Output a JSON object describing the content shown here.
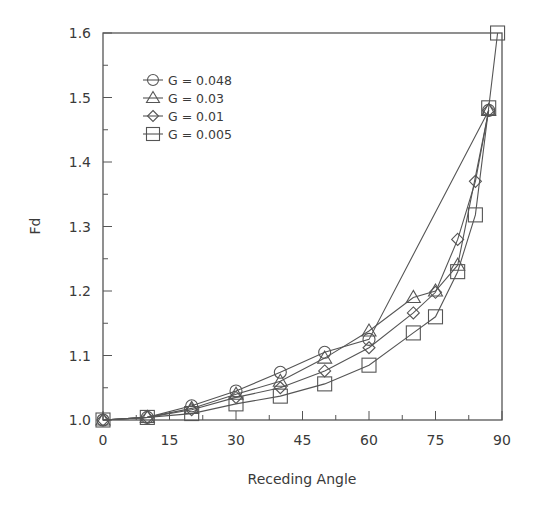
{
  "chart_data": {
    "type": "line",
    "title": "",
    "xlabel": "Receding Angle",
    "ylabel": "Fd",
    "xlim": [
      0,
      90
    ],
    "ylim": [
      1.0,
      1.6
    ],
    "xticks": [
      0,
      15,
      30,
      45,
      60,
      75,
      90
    ],
    "xtick_labels": [
      "0",
      "15",
      "30",
      "45",
      "60",
      "75",
      "90"
    ],
    "x_minor_step": 7.5,
    "yticks": [
      1.0,
      1.1,
      1.2,
      1.3,
      1.4,
      1.5,
      1.6
    ],
    "ytick_labels": [
      "1.0",
      "1.1",
      "1.2",
      "1.3",
      "1.4",
      "1.5",
      "1.6"
    ],
    "y_minor_step": 0.05,
    "grid": false,
    "legend_position": "upper left",
    "line_color": "#555555",
    "series": [
      {
        "name": "G = 0.048",
        "marker": "circle",
        "x": [
          0,
          10,
          20,
          30,
          40,
          50,
          60,
          87
        ],
        "y": [
          1.0,
          1.004,
          1.022,
          1.045,
          1.074,
          1.105,
          1.125,
          1.48
        ]
      },
      {
        "name": "G = 0.03",
        "marker": "triangle",
        "x": [
          0,
          10,
          20,
          30,
          40,
          50,
          60,
          70,
          75,
          80,
          87
        ],
        "y": [
          1.0,
          1.004,
          1.018,
          1.04,
          1.06,
          1.096,
          1.138,
          1.19,
          1.2,
          1.24,
          1.48
        ]
      },
      {
        "name": "G = 0.01",
        "marker": "diamond",
        "x": [
          0,
          10,
          20,
          30,
          40,
          50,
          60,
          70,
          75,
          80,
          84,
          87
        ],
        "y": [
          1.0,
          1.004,
          1.016,
          1.035,
          1.05,
          1.076,
          1.112,
          1.166,
          1.198,
          1.28,
          1.37,
          1.48
        ]
      },
      {
        "name": "G = 0.005",
        "marker": "square",
        "x": [
          0,
          10,
          20,
          30,
          40,
          50,
          60,
          70,
          75,
          80,
          84,
          87,
          89
        ],
        "y": [
          1.0,
          1.004,
          1.01,
          1.025,
          1.037,
          1.056,
          1.085,
          1.135,
          1.16,
          1.23,
          1.318,
          1.484,
          1.6
        ]
      }
    ]
  }
}
